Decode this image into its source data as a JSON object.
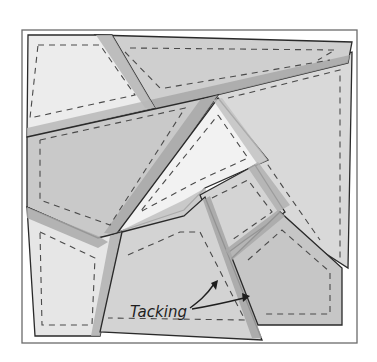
{
  "diagram": {
    "type": "quilt-piecing-illustration",
    "annotation_label": "Tacking",
    "colors": {
      "background": "#ffffff",
      "frame_stroke": "#6b6b6b",
      "piece_light": "#e8e8e8",
      "piece_lightest": "#f0f0f0",
      "piece_medium": "#c9c9c9",
      "piece_mid": "#d6d6d6",
      "seam_allowance": "#a9a9a9",
      "outline": "#2a2a2a",
      "stitch": "#4a4a4a"
    },
    "pieces": [
      {
        "id": "top-left",
        "shade": "light"
      },
      {
        "id": "top-right-wedge",
        "shade": "medium"
      },
      {
        "id": "right-large",
        "shade": "mid"
      },
      {
        "id": "left-middle",
        "shade": "medium"
      },
      {
        "id": "center-triangle",
        "shade": "lightest"
      },
      {
        "id": "center-small-square",
        "shade": "mid"
      },
      {
        "id": "bottom-left",
        "shade": "light"
      },
      {
        "id": "bottom-center",
        "shade": "mid"
      },
      {
        "id": "bottom-right-pentagon",
        "shade": "medium"
      }
    ],
    "arrows": [
      {
        "id": "tacking-arrow-1",
        "points_to": "bottom-center seam"
      },
      {
        "id": "tacking-arrow-2",
        "points_to": "bottom-right seam"
      }
    ]
  }
}
